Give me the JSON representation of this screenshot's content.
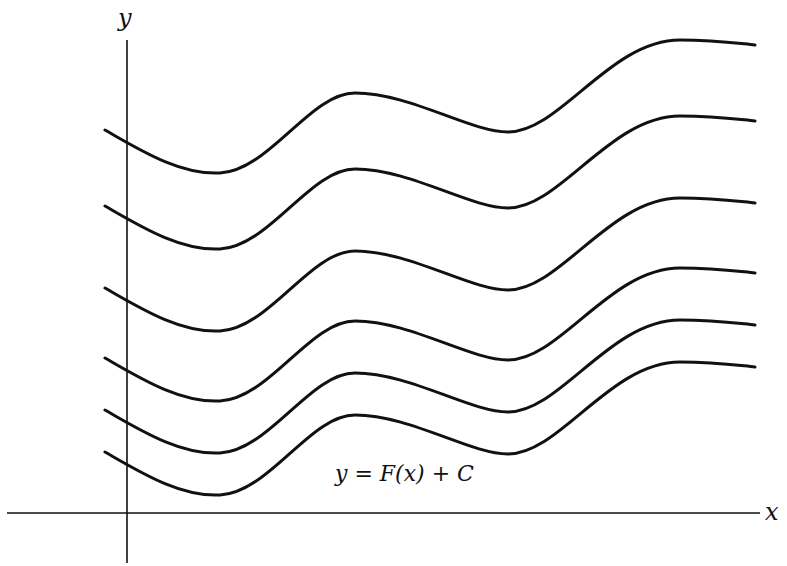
{
  "figure": {
    "type": "diagram",
    "axes": {
      "x_label": "x",
      "y_label": "y"
    },
    "equation": "y = F(x) + C",
    "curve_count": 6,
    "curve_vertical_offsets_px": [
      0,
      76,
      158,
      228,
      280,
      322
    ],
    "colors": {
      "background": "#ffffff",
      "ink": "#111111"
    }
  }
}
